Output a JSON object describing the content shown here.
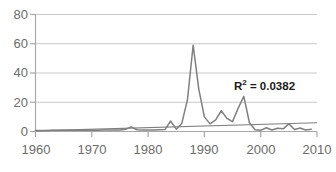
{
  "chart_data": {
    "type": "line",
    "title": "",
    "xlabel": "",
    "ylabel": "",
    "xlim": [
      1960,
      2010
    ],
    "ylim": [
      0,
      80
    ],
    "yticks": [
      0,
      20,
      40,
      60,
      80
    ],
    "xticks": [
      1960,
      1970,
      1980,
      1990,
      2000,
      2010
    ],
    "grid": true,
    "grid_axis": "y",
    "legend": false,
    "annotations": [
      {
        "name": "r-squared",
        "text": "R² = 0.0382",
        "base": "R",
        "exponent": "2",
        "rest": " = 0.0382",
        "x": 1998,
        "y": 30
      }
    ],
    "series": [
      {
        "name": "data",
        "kind": "line",
        "color": "#808080",
        "x": [
          1960,
          1961,
          1962,
          1963,
          1964,
          1965,
          1966,
          1967,
          1968,
          1969,
          1970,
          1971,
          1972,
          1973,
          1974,
          1975,
          1976,
          1977,
          1978,
          1979,
          1980,
          1981,
          1982,
          1983,
          1984,
          1985,
          1986,
          1987,
          1988,
          1989,
          1990,
          1991,
          1992,
          1993,
          1994,
          1995,
          1996,
          1997,
          1998,
          1999,
          2000,
          2001,
          2002,
          2003,
          2004,
          2005,
          2006,
          2007,
          2008,
          2009
        ],
        "values": [
          0.7,
          0.7,
          0.7,
          0.8,
          0.8,
          0.8,
          0.8,
          0.8,
          0.9,
          0.9,
          0.9,
          0.9,
          1.0,
          1.0,
          1.0,
          1.1,
          1.5,
          3.2,
          1.2,
          1.0,
          1.1,
          1.1,
          1.2,
          1.3,
          7.2,
          1.6,
          5.7,
          22.0,
          59.0,
          29.0,
          10.0,
          5.2,
          8.0,
          14.2,
          9.0,
          6.8,
          16.0,
          24.0,
          6.0,
          1.2,
          0.8,
          2.6,
          1.0,
          2.2,
          1.8,
          5.2,
          1.4,
          2.4,
          1.0,
          1.6
        ]
      },
      {
        "name": "linear-trendline",
        "kind": "trendline",
        "color": "#808080",
        "x": [
          1960,
          2010
        ],
        "values": [
          0.4,
          6.0
        ]
      }
    ]
  },
  "axes": {
    "y_tick_labels": [
      "80",
      "60",
      "40",
      "20",
      "0"
    ],
    "x_tick_labels": [
      "1960",
      "1970",
      "1980",
      "1990",
      "2000",
      "2010"
    ]
  },
  "colors": {
    "series": "#808080",
    "trendline": "#808080",
    "grid": "#c9c9c9",
    "axis": "#a8a8a8",
    "tick_text": "#6b6b6b",
    "annotation_text": "#1a1a1a",
    "background": "#ffffff"
  }
}
